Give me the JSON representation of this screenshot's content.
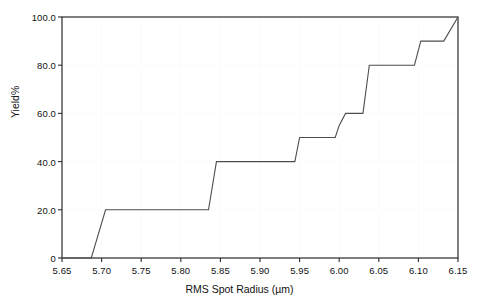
{
  "chart_data": {
    "type": "line",
    "title": "",
    "xlabel": "RMS Spot Radius (µm)",
    "ylabel": "Yield%",
    "xlim": [
      5.65,
      6.15
    ],
    "ylim": [
      0,
      100
    ],
    "xticks": [
      5.65,
      5.7,
      5.75,
      5.8,
      5.85,
      5.9,
      5.95,
      6.0,
      6.05,
      6.1,
      6.15
    ],
    "xticklabels": [
      "5.65",
      "5.70",
      "5.75",
      "5.80",
      "5.85",
      "5.90",
      "5.95",
      "6.00",
      "6.05",
      "6.10",
      "6.15"
    ],
    "yticks": [
      0,
      20,
      40,
      60,
      80,
      100
    ],
    "yticklabels": [
      "0",
      "20.0",
      "40.0",
      "60.0",
      "80.0",
      "100.0"
    ],
    "grid": true,
    "legend": null,
    "line_color": "#4d4d4d",
    "line_width": 1.1,
    "series": [
      {
        "name": "Cumulative Yield",
        "x": [
          5.65,
          5.687,
          5.705,
          5.835,
          5.845,
          5.944,
          5.95,
          5.995,
          6.0,
          6.008,
          6.03,
          6.038,
          6.062,
          6.095,
          6.103,
          6.132,
          6.15
        ],
        "y": [
          0,
          0,
          20,
          20,
          40,
          40,
          50,
          50,
          55,
          60,
          60,
          80,
          80,
          80,
          90,
          90,
          100
        ]
      }
    ]
  },
  "axes": {
    "x_title": "RMS Spot Radius (µm)",
    "y_title": "Yield%"
  }
}
